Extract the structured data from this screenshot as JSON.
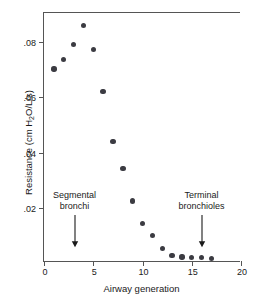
{
  "chart_data": {
    "type": "scatter",
    "title": "",
    "xlabel": "Airway generation",
    "ylabel": "Resistance (cm H2O/L/s)",
    "ylabel_parts": {
      "pre": "Resistance (cm H",
      "sub": "2",
      "post": "O/L/s)"
    },
    "xlim": [
      0,
      20
    ],
    "ylim": [
      0,
      0.0905
    ],
    "xticks": [
      0,
      5,
      10,
      15,
      20
    ],
    "xtick_labels": [
      "0",
      "5",
      "10",
      "15",
      "20"
    ],
    "yticks": [
      0.02,
      0.04,
      0.06,
      0.08
    ],
    "ytick_labels": [
      ".02",
      ".04",
      ".06",
      ".08"
    ],
    "grid": false,
    "legend": null,
    "marker_color": "#3b3b42",
    "axis_color": "#555555",
    "x": [
      1,
      2,
      3,
      4,
      5,
      6,
      7,
      8,
      9,
      10,
      11,
      12,
      13,
      14,
      15,
      16,
      17
    ],
    "y": [
      0.0703,
      0.0736,
      0.079,
      0.086,
      0.0773,
      0.062,
      0.044,
      0.0343,
      0.0224,
      0.0144,
      0.0099,
      0.0053,
      0.0028,
      0.0022,
      0.0021,
      0.0021,
      0.0017
    ],
    "series_name": "Airway resistance by generation",
    "annotations": [
      {
        "id": "segmental-bronchi",
        "line1": "Segmental",
        "line2": "bronchi",
        "x_value": 3.1,
        "arrow_from_y": 0.0172,
        "arrow_to_y": 0.0055
      },
      {
        "id": "terminal-bronchioles",
        "line1": "Terminal",
        "line2": "bronchioles",
        "x_value": 16.0,
        "arrow_from_y": 0.0172,
        "arrow_to_y": 0.0055
      }
    ]
  }
}
